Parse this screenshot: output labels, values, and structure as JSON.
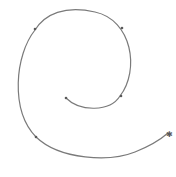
{
  "diagram": {
    "type": "spiral",
    "stroke_color": "#7a7a7a",
    "marker_color": "#5a5a5a",
    "path": "M66,98 C80,112 110,112 120,96 C140,70 132,20 95,12 C65,5 45,14 35,30 C15,55 10,110 36,137 C60,160 110,162 135,152 C150,146 160,140 168,133",
    "markers": [
      {
        "x": 66,
        "y": 98,
        "shape": "dot"
      },
      {
        "x": 121,
        "y": 96,
        "shape": "dot"
      },
      {
        "x": 122,
        "y": 28,
        "shape": "dot"
      },
      {
        "x": 35,
        "y": 29,
        "shape": "dot"
      },
      {
        "x": 36,
        "y": 137,
        "shape": "dot"
      },
      {
        "x": 169,
        "y": 137,
        "shape": "star"
      }
    ]
  }
}
